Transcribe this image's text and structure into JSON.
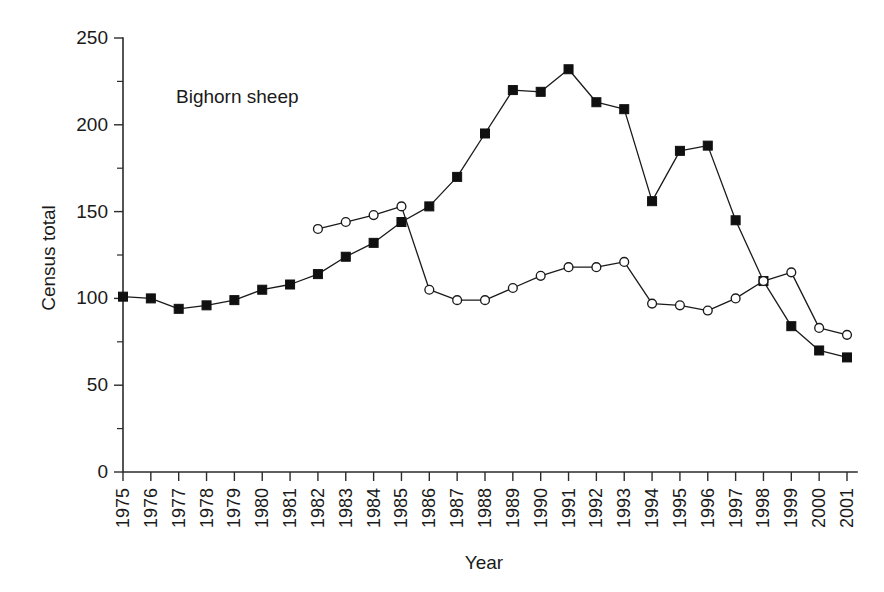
{
  "chart_data": {
    "type": "line",
    "title": "",
    "annotation": "Bighorn sheep",
    "xlabel": "Year",
    "ylabel": "Census total",
    "grid": false,
    "legend_position": "none",
    "ylim": [
      0,
      250
    ],
    "yticks": [
      0,
      50,
      100,
      150,
      200,
      250
    ],
    "ytick_labels": [
      "0",
      "50",
      "100",
      "150",
      "200",
      "250"
    ],
    "y_minor_ticks": [
      25,
      75,
      125,
      175,
      225
    ],
    "categories": [
      "1975",
      "1976",
      "1977",
      "1978",
      "1979",
      "1980",
      "1981",
      "1982",
      "1983",
      "1984",
      "1985",
      "1986",
      "1987",
      "1988",
      "1989",
      "1990",
      "1991",
      "1992",
      "1993",
      "1994",
      "1995",
      "1996",
      "1997",
      "1998",
      "1999",
      "2000",
      "2001"
    ],
    "x": [
      1975,
      1976,
      1977,
      1978,
      1979,
      1980,
      1981,
      1982,
      1983,
      1984,
      1985,
      1986,
      1987,
      1988,
      1989,
      1990,
      1991,
      1992,
      1993,
      1994,
      1995,
      1996,
      1997,
      1998,
      1999,
      2000,
      2001
    ],
    "series": [
      {
        "name": "filled-square-series",
        "marker": "filled-square",
        "color": "#101010",
        "values": [
          101,
          100,
          94,
          96,
          99,
          105,
          108,
          114,
          124,
          132,
          144,
          153,
          170,
          195,
          220,
          219,
          232,
          213,
          209,
          156,
          185,
          188,
          145,
          110,
          84,
          70,
          66
        ]
      },
      {
        "name": "open-circle-series",
        "marker": "open-circle",
        "color": "#1a1a1a",
        "values": [
          null,
          null,
          null,
          null,
          null,
          null,
          null,
          140,
          144,
          148,
          153,
          105,
          99,
          99,
          106,
          113,
          118,
          118,
          121,
          97,
          96,
          93,
          100,
          110,
          115,
          83,
          79
        ]
      }
    ]
  },
  "axes": {
    "x_title": "Year",
    "y_title": "Census total"
  }
}
